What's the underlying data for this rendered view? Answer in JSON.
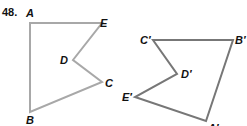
{
  "problem": {
    "number": "48."
  },
  "colors": {
    "original": "#a8a8a8",
    "image": "#777777",
    "text": "#111111"
  },
  "figures": [
    {
      "name": "original-pentagon",
      "vertices": [
        {
          "label": "A",
          "x": 30,
          "y": 23
        },
        {
          "label": "E",
          "x": 102,
          "y": 23
        },
        {
          "label": "D",
          "x": 73,
          "y": 60
        },
        {
          "label": "C",
          "x": 102,
          "y": 82
        },
        {
          "label": "B",
          "x": 30,
          "y": 112
        }
      ]
    },
    {
      "name": "image-pentagon",
      "vertices": [
        {
          "label": "C′",
          "x": 153,
          "y": 40
        },
        {
          "label": "B′",
          "x": 233,
          "y": 40
        },
        {
          "label": "A′",
          "x": 206,
          "y": 121
        },
        {
          "label": "E′",
          "x": 135,
          "y": 97
        },
        {
          "label": "D′",
          "x": 177,
          "y": 74
        }
      ]
    }
  ],
  "labels": {
    "A": "A",
    "B": "B",
    "C": "C",
    "D": "D",
    "E": "E",
    "A_prime": "A′",
    "B_prime": "B′",
    "C_prime": "C′",
    "D_prime": "D′",
    "E_prime": "E′"
  }
}
